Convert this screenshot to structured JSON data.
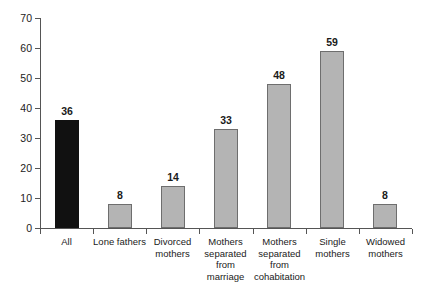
{
  "chart_data": {
    "type": "bar",
    "title": "",
    "subtitle": "",
    "xlabel": "",
    "ylabel": "",
    "ylim": [
      0,
      70
    ],
    "yticks": [
      0,
      10,
      20,
      30,
      40,
      50,
      60,
      70
    ],
    "grid": false,
    "legend": null,
    "categories": [
      "All",
      "Lone fathers",
      "Divorced mothers",
      "Mothers separated from marriage",
      "Mothers separated from cohabitation",
      "Single mothers",
      "Widowed mothers"
    ],
    "category_lines": [
      [
        "All"
      ],
      [
        "Lone fathers"
      ],
      [
        "Divorced",
        "mothers"
      ],
      [
        "Mothers",
        "separated",
        "from",
        "marriage"
      ],
      [
        "Mothers",
        "separated",
        "from",
        "cohabitation"
      ],
      [
        "Single",
        "mothers"
      ],
      [
        "Widowed",
        "mothers"
      ]
    ],
    "values": [
      36,
      8,
      14,
      33,
      48,
      59,
      8
    ],
    "value_labels": [
      "36",
      "8",
      "14",
      "33",
      "48",
      "59",
      "8"
    ],
    "bar_colors": [
      "#111111",
      "#b4b4b4",
      "#b4b4b4",
      "#b4b4b4",
      "#b4b4b4",
      "#b4b4b4",
      "#b4b4b4"
    ],
    "highlight_index": 0,
    "colors": {
      "highlight_bar": "#111111",
      "bar_fill": "#b4b4b4",
      "bar_border": "#6e6e6e",
      "axis": "#555555",
      "text": "#1a1a1a",
      "background": "#ffffff"
    }
  }
}
